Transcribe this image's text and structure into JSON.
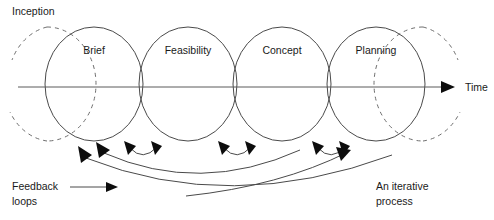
{
  "diagram": {
    "background_color": "#ffffff",
    "stroke_color": "#4a4a4a",
    "arrow_color": "#0d0d0d",
    "text_color": "#1a1a1a",
    "phases": [
      {
        "label": "Brief",
        "cx": 94,
        "cy": 84,
        "rx": 49,
        "ry": 57
      },
      {
        "label": "Feasibility",
        "cx": 188,
        "cy": 84,
        "rx": 49,
        "ry": 57
      },
      {
        "label": "Concept",
        "cx": 282,
        "cy": 84,
        "rx": 49,
        "ry": 57
      },
      {
        "label": "Planning",
        "cx": 376,
        "cy": 84,
        "rx": 49,
        "ry": 57
      }
    ],
    "ghost_circles": [
      {
        "name": "inception-ghost",
        "cx": 47,
        "cy": 84,
        "rx": 49,
        "ry": 57
      },
      {
        "name": "continuation-ghost",
        "cx": 423,
        "cy": 84,
        "rx": 49,
        "ry": 57
      }
    ],
    "axis": {
      "label": "Time",
      "label_x": 465,
      "label_y": 88,
      "y": 87,
      "x_start": 18,
      "x_end": 452
    },
    "annotations": [
      {
        "name": "inception",
        "line1": "Inception",
        "line2": "",
        "x": 12,
        "y": 14
      },
      {
        "name": "feedback-loops",
        "line1": "Feedback",
        "line2": "loops",
        "x": 12,
        "y": 190
      },
      {
        "name": "iterative-process",
        "line1": "An iterative",
        "line2": "process",
        "x": 376,
        "y": 190
      }
    ],
    "short_loops": [
      {
        "from_x": 158,
        "to_x": 128,
        "peak_y": 157,
        "base_y": 142
      },
      {
        "from_x": 252,
        "to_x": 222,
        "peak_y": 157,
        "base_y": 142
      },
      {
        "from_x": 346,
        "to_x": 316,
        "peak_y": 157,
        "base_y": 142
      }
    ],
    "long_loops": [
      {
        "from_x": 300,
        "to_x": 102,
        "depth_y": 184
      },
      {
        "from_x": 392,
        "to_x": 80,
        "depth_y": 200
      },
      {
        "from_x": 196,
        "to_x": 330,
        "depth_y": 176
      }
    ],
    "pointer_arrow": {
      "x1": 72,
      "y1": 190,
      "x2": 112,
      "y2": 190
    }
  }
}
